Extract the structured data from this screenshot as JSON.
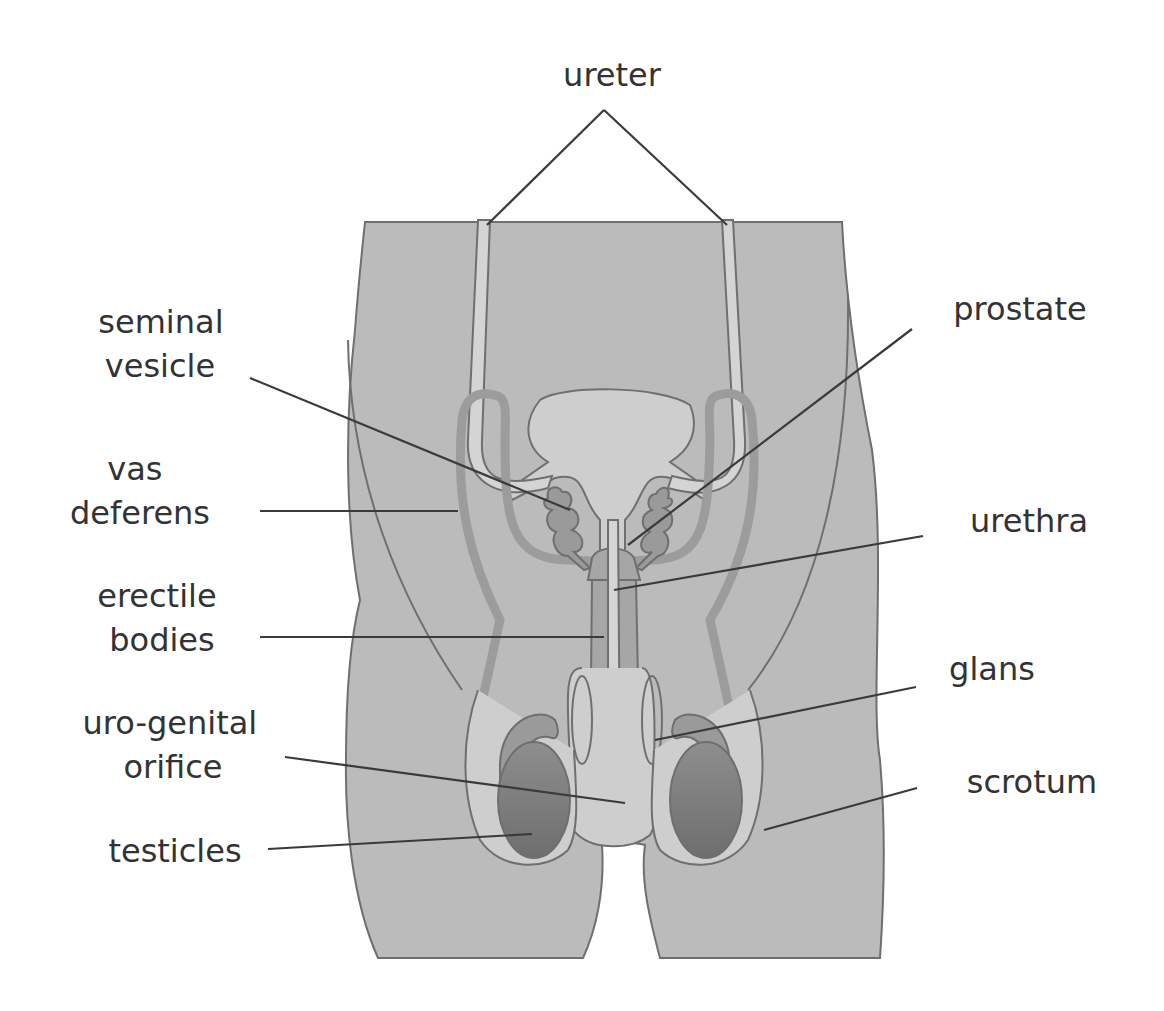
{
  "colors": {
    "background": "#ffffff",
    "body": "#bbbbbb",
    "inner_light": "#cecece",
    "tube_light": "#d4d4d4",
    "vas_deferens": "#9c9c9c",
    "erectile": "#a6a6a6",
    "epididymis": "#9a9a9a",
    "testicle_top": "#8e8e8e",
    "testicle_bottom": "#6e6e6e",
    "outline": "#6f6f6f",
    "label_text": "#333333",
    "leader_line": "#3a3a3a"
  },
  "labels": {
    "ureter": "ureter",
    "seminal_vesicle": [
      "seminal",
      "vesicle"
    ],
    "vas_deferens": [
      "vas",
      "deferens"
    ],
    "erectile_bodies": [
      "erectile",
      "bodies"
    ],
    "uro_genital_orifice": [
      "uro-genital",
      "orifice"
    ],
    "testicles": "testicles",
    "prostate": "prostate",
    "urethra": "urethra",
    "glans": "glans",
    "scrotum": "scrotum"
  }
}
